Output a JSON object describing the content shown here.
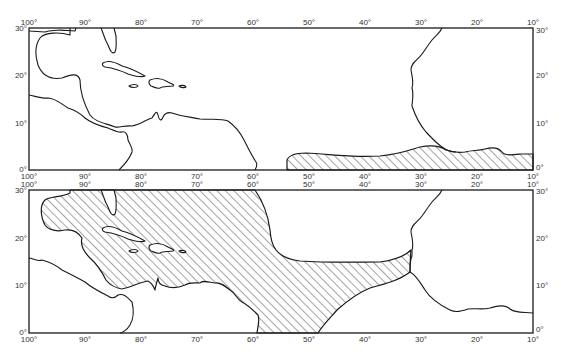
{
  "figure": {
    "panels": [
      {
        "id": "top",
        "description": "Map panel 1 - Tropical Atlantic, shaded region along equatorial West Africa coast",
        "frame": {
          "x": 29,
          "y": 28,
          "w": 504,
          "h": 142
        },
        "shaded_region_label": "hatched area: 44°W–10°E, ~0°–4°N"
      },
      {
        "id": "bottom",
        "description": "Map panel 2 - Tropical Atlantic, shaded region covering Caribbean/Gulf of Mexico and band to West Africa",
        "frame": {
          "x": 29,
          "y": 190,
          "w": 504,
          "h": 143
        },
        "shaded_region_label": "hatched area: Gulf of Mexico, Caribbean, band 50°W–17°W, ~8°N–15°N"
      }
    ],
    "longitude_labels": [
      "100°",
      "90°",
      "80°",
      "70°",
      "60°",
      "50°",
      "40°",
      "30°",
      "20°",
      "10°",
      "0°",
      "10°"
    ],
    "latitude_labels_left": [
      "30°",
      "20°",
      "10°",
      "0°"
    ],
    "latitude_labels_right": [
      "30°",
      "20°",
      "10°",
      "0°"
    ],
    "colors": {
      "line": "#1a1a1a",
      "background": "#ffffff",
      "label": "#333333"
    }
  }
}
